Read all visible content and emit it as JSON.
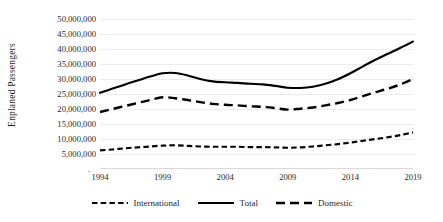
{
  "chart_data": {
    "type": "line",
    "title": "",
    "xlabel": "",
    "ylabel": "Enplaned Passengers",
    "x": [
      1994,
      1995,
      1996,
      1997,
      1998,
      1999,
      2000,
      2001,
      2002,
      2003,
      2004,
      2005,
      2006,
      2007,
      2008,
      2009,
      2010,
      2011,
      2012,
      2013,
      2014,
      2015,
      2016,
      2017,
      2018,
      2019
    ],
    "xlim": [
      1994,
      2019
    ],
    "ylim": [
      0,
      50000000
    ],
    "ytick_values": [
      5000000,
      10000000,
      15000000,
      20000000,
      25000000,
      30000000,
      35000000,
      40000000,
      45000000,
      50000000
    ],
    "ytick_labels": [
      "5,000,000",
      "10,000,000",
      "15,000,000",
      "20,000,000",
      "25,000,000",
      "30,000,000",
      "35,000,000",
      "40,000,000",
      "45,000,000",
      "50,000,000"
    ],
    "xtick_values": [
      1994,
      1999,
      2004,
      2009,
      2014,
      2019
    ],
    "xtick_labels": [
      "1994",
      "1999",
      "2004",
      "2009",
      "2014",
      "2019"
    ],
    "origin_marker": "-",
    "grid": true,
    "grid_color": "#ececec",
    "legend_position": "bottom",
    "line_color": "#000000",
    "series": [
      {
        "name": "International",
        "style": "dash-dot",
        "values": [
          6200000,
          6500000,
          6900000,
          7200000,
          7500000,
          7800000,
          7900000,
          7700000,
          7500000,
          7400000,
          7400000,
          7400000,
          7300000,
          7300000,
          7200000,
          7100000,
          7200000,
          7500000,
          7900000,
          8300000,
          8800000,
          9400000,
          10000000,
          10600000,
          11300000,
          12200000
        ]
      },
      {
        "name": "Total",
        "style": "solid",
        "values": [
          25400000,
          26800000,
          28200000,
          29500000,
          30800000,
          31900000,
          32000000,
          31200000,
          30000000,
          29200000,
          28900000,
          28700000,
          28400000,
          28200000,
          27700000,
          27100000,
          27000000,
          27400000,
          28400000,
          29900000,
          31900000,
          34200000,
          36400000,
          38400000,
          40400000,
          42500000
        ]
      },
      {
        "name": "Domestic",
        "style": "dashed",
        "values": [
          19000000,
          20000000,
          21000000,
          22000000,
          23000000,
          23900000,
          23600000,
          23000000,
          22300000,
          21700000,
          21400000,
          21200000,
          20900000,
          20700000,
          20300000,
          19800000,
          20100000,
          20500000,
          21200000,
          22000000,
          23000000,
          24300000,
          25600000,
          26800000,
          28200000,
          30000000
        ]
      }
    ]
  },
  "legend": {
    "items": [
      {
        "label": "International"
      },
      {
        "label": "Total"
      },
      {
        "label": "Domestic"
      }
    ]
  }
}
